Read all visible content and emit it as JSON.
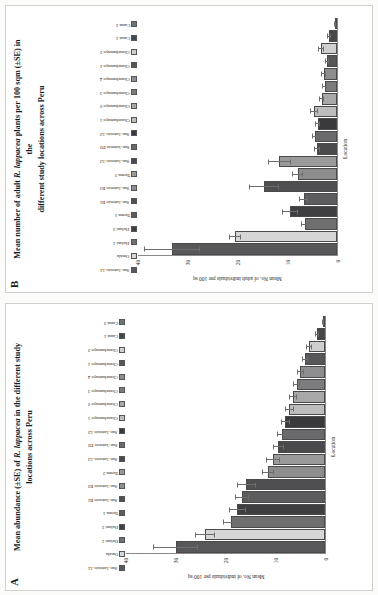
{
  "figure": {
    "background": "#fbfbfa",
    "panels": [
      "B",
      "A"
    ]
  },
  "panelB": {
    "letter": "B",
    "title_line1": "Mean number of adult ",
    "title_species": "R. lappacea",
    "title_line2": " plants per 100 sqm (±SE) in the",
    "title_line3": "different study locations across Peru",
    "xlabel": "Location",
    "ylabel": "Mean No. of adult individuals per 100 sq",
    "chart_data": {
      "type": "bar",
      "title": "Mean number of adult R. lappacea plants per 100 sqm (±SE) in the different study locations across Peru",
      "xlabel": "Location",
      "ylabel": "Mean No. of adult individuals per 100 sq",
      "ylim": [
        0,
        40
      ],
      "yticks": [
        0,
        10,
        20,
        30,
        40
      ],
      "grid": false,
      "legend_position": "top",
      "categories": [
        "San Antonio A1",
        "Omala",
        "Huluni 1",
        "Huluni 2",
        "Tarma 1",
        "San Antonio B1",
        "San Antonio B3",
        "Tarma 2",
        "San Antonio A3",
        "San Antonio D2",
        "San Antonio A2",
        "Chanchamayo 5",
        "Chanchamayo 6",
        "Chanchamayo 3",
        "Chanchamayo 4",
        "Chanchamayo 1",
        "Chanchamayo 2",
        "Canat 1",
        "Canat 2"
      ],
      "values": [
        33.1,
        20.4,
        6.4,
        9.3,
        6.6,
        14.6,
        7.8,
        11.5,
        3.9,
        4.3,
        3.8,
        4.5,
        3.0,
        2.4,
        2.6,
        2.0,
        3.2,
        1.6,
        0.3
      ],
      "errors": [
        5.6,
        1.2,
        0.8,
        1.6,
        0.9,
        3.1,
        1.1,
        2.4,
        0.6,
        0.7,
        0.5,
        0.8,
        0.5,
        0.5,
        0.5,
        0.4,
        0.6,
        0.4,
        0.2
      ],
      "colors": [
        "#58585a",
        "#d6d6d6",
        "#6f6f70",
        "#3f3f41",
        "#5c5c5e",
        "#4f4f51",
        "#8d8d8e",
        "#9a9a9b",
        "#4a4a4c",
        "#6a6a6c",
        "#3a3a3c",
        "#bdbdbd",
        "#a8a8a9",
        "#7c7c7e",
        "#8e8e90",
        "#575759",
        "#cfcfcf",
        "#474749",
        "#737375"
      ]
    },
    "legend": [
      {
        "label": "San Antonio A1",
        "color": "#58585a"
      },
      {
        "label": "Omala",
        "color": "#d6d6d6"
      },
      {
        "label": "Huluni 1",
        "color": "#6f6f70"
      },
      {
        "label": "Huluni 2",
        "color": "#3f3f41"
      },
      {
        "label": "Tarma 1",
        "color": "#5c5c5e"
      },
      {
        "label": "San Antonio B1",
        "color": "#4f4f51"
      },
      {
        "label": "San Antonio B3",
        "color": "#8d8d8e"
      },
      {
        "label": "Tarma 2",
        "color": "#9a9a9b"
      },
      {
        "label": "San Antonio A3",
        "color": "#4a4a4c"
      },
      {
        "label": "San Antonio D2",
        "color": "#6a6a6c"
      },
      {
        "label": "San Antonio A2",
        "color": "#3a3a3c"
      },
      {
        "label": "Chanchamayo 5",
        "color": "#bdbdbd"
      },
      {
        "label": "Chanchamayo 6",
        "color": "#a8a8a9"
      },
      {
        "label": "Chanchamayo 3",
        "color": "#7c7c7e"
      },
      {
        "label": "Chanchamayo 4",
        "color": "#8e8e90"
      },
      {
        "label": "Chanchamayo 1",
        "color": "#575759"
      },
      {
        "label": "Chanchamayo 2",
        "color": "#cfcfcf"
      },
      {
        "label": "Canat 1",
        "color": "#474749"
      },
      {
        "label": "Canat 2",
        "color": "#737375"
      }
    ]
  },
  "panelA": {
    "letter": "A",
    "title_line1": "Mean abundance (±SE) of ",
    "title_species": "R. lappacea",
    "title_line2": " in the different study",
    "title_line3": "locations across Peru",
    "xlabel": "Location",
    "ylabel": "Mean No. of individuals per 100 sq",
    "chart_data": {
      "type": "bar",
      "title": "Mean abundance (±SE) of R. lappacea in the different study locations across Peru",
      "xlabel": "Location",
      "ylabel": "Mean No. of individuals per 100 sq",
      "ylim": [
        0,
        40
      ],
      "yticks": [
        0,
        10,
        20,
        30,
        40
      ],
      "grid": false,
      "legend_position": "top",
      "categories": [
        "San Antonio A1",
        "Omala",
        "Huluni 1",
        "Huluni 2",
        "Tarma 1",
        "San Antonio B1",
        "San Antonio B3",
        "Tarma 2",
        "San Antonio A3",
        "San Antonio D2",
        "San Antonio A2",
        "Chanchamayo 5",
        "Chanchamayo 6",
        "Chanchamayo 3",
        "Chanchamayo 4",
        "Chanchamayo 1",
        "Chanchamayo 2",
        "Canat 1",
        "Canat 2"
      ],
      "values": [
        30.0,
        24.0,
        18.8,
        17.6,
        16.6,
        15.8,
        11.4,
        10.4,
        9.4,
        8.6,
        7.9,
        7.1,
        6.4,
        5.6,
        4.9,
        4.0,
        3.2,
        1.6,
        0.4
      ],
      "errors": [
        4.6,
        2.0,
        1.6,
        1.7,
        1.4,
        1.9,
        1.2,
        1.4,
        1.1,
        1.0,
        0.9,
        0.9,
        0.8,
        0.7,
        0.7,
        0.6,
        0.6,
        0.4,
        0.2
      ],
      "colors": [
        "#58585a",
        "#d6d6d6",
        "#6f6f70",
        "#3f3f41",
        "#5c5c5e",
        "#4f4f51",
        "#8d8d8e",
        "#9a9a9b",
        "#4a4a4c",
        "#6a6a6c",
        "#3a3a3c",
        "#bdbdbd",
        "#a8a8a9",
        "#7c7c7e",
        "#8e8e90",
        "#575759",
        "#cfcfcf",
        "#474749",
        "#737375"
      ]
    },
    "legend": [
      {
        "label": "San Antonio A1",
        "color": "#58585a"
      },
      {
        "label": "Omala",
        "color": "#d6d6d6"
      },
      {
        "label": "Huluni 1",
        "color": "#6f6f70"
      },
      {
        "label": "Huluni 2",
        "color": "#3f3f41"
      },
      {
        "label": "Tarma 1",
        "color": "#5c5c5e"
      },
      {
        "label": "San Antonio B1",
        "color": "#4f4f51"
      },
      {
        "label": "San Antonio B3",
        "color": "#8d8d8e"
      },
      {
        "label": "Tarma 2",
        "color": "#9a9a9b"
      },
      {
        "label": "San Antonio A3",
        "color": "#4a4a4c"
      },
      {
        "label": "San Antonio D2",
        "color": "#6a6a6c"
      },
      {
        "label": "San Antonio A2",
        "color": "#3a3a3c"
      },
      {
        "label": "Chanchamayo 5",
        "color": "#bdbdbd"
      },
      {
        "label": "Chanchamayo 6",
        "color": "#a8a8a9"
      },
      {
        "label": "Chanchamayo 3",
        "color": "#7c7c7e"
      },
      {
        "label": "Chanchamayo 4",
        "color": "#8e8e90"
      },
      {
        "label": "Chanchamayo 1",
        "color": "#575759"
      },
      {
        "label": "Chanchamayo 2",
        "color": "#cfcfcf"
      },
      {
        "label": "Canat 1",
        "color": "#474749"
      },
      {
        "label": "Canat 2",
        "color": "#737375"
      }
    ]
  }
}
